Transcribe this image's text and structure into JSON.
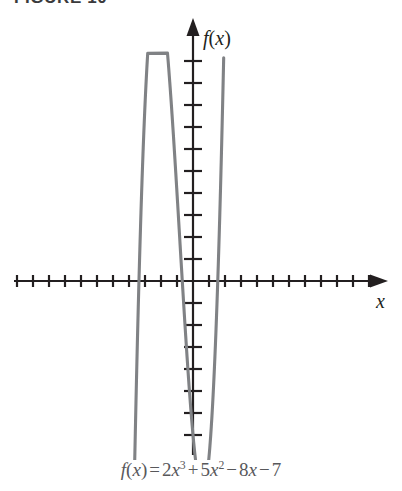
{
  "figure": {
    "title": "FIGURE 10",
    "caption_plain": "f(x) = 2x^3 + 5x^2 - 8x - 7"
  },
  "axes": {
    "y_label": "f(x)",
    "x_label": "x",
    "x_arrow_icon": "arrow-right-icon",
    "y_arrow_icon": "arrow-up-icon",
    "origin_px": [
      193,
      281
    ],
    "x_tick_spacing_px": 16,
    "y_tick_spacing_px": 22,
    "x_tick_count_left": 11,
    "x_tick_count_right": 11,
    "y_tick_count_up": 10,
    "y_tick_count_down": 7,
    "tick_half_len_px": 6,
    "axis_color": "#231f20",
    "curve_color": "#808285",
    "background": "#ffffff"
  },
  "chart_data": {
    "type": "line",
    "title": "FIGURE 10",
    "xlabel": "x",
    "ylabel": "f(x)",
    "grid": false,
    "legend": null,
    "function": "f(x) = 2x^3 + 5x^2 - 8x - 7",
    "coefficients": {
      "a": 2,
      "b": 5,
      "c": -8,
      "d": -7
    },
    "xlim": [
      -11,
      11
    ],
    "ylim": [
      -7,
      10
    ],
    "x_unit_px": 16,
    "y_unit_px": 22,
    "annotations": [
      {
        "label": "local maximum",
        "x": -2.31,
        "y": 5.6
      },
      {
        "label": "local minimum",
        "x": 0.58,
        "y": -9.6
      },
      {
        "label": "x-intercept",
        "x": -1.07,
        "y": 0
      },
      {
        "label": "x-intercept",
        "x": 1.55,
        "y": 0
      }
    ],
    "x": [
      -3.85,
      -3.6,
      -3.3,
      -3.0,
      -2.7,
      -2.31,
      -2.0,
      -1.6,
      -1.07,
      -0.6,
      0.0,
      0.58,
      1.0,
      1.3,
      1.55,
      1.8,
      2.0
    ],
    "y": [
      -9.2,
      -3.8,
      1.1,
      4.0,
      5.4,
      5.6,
      5.0,
      3.0,
      0.0,
      -3.8,
      -7.0,
      -9.6,
      -8.0,
      -4.3,
      0.0,
      5.5,
      12.6
    ]
  }
}
